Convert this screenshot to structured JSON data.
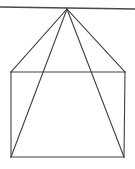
{
  "figure": {
    "type": "geometric-line-drawing",
    "background_color": "#ffffff",
    "line_color": "#404040",
    "horizon_line_color": "#4a4a4a",
    "canvas": {
      "width": 135,
      "height": 169
    },
    "points": {
      "apex": {
        "label": "apex",
        "x": 67,
        "y": 9
      },
      "top_left": {
        "label": "top-left",
        "x": 11,
        "y": 72
      },
      "top_right": {
        "label": "top-right",
        "x": 125,
        "y": 72
      },
      "bottom_left": {
        "label": "bottom-left",
        "x": 11,
        "y": 157
      },
      "bottom_right": {
        "label": "bottom-right",
        "x": 124,
        "y": 157
      },
      "horizon_left": {
        "label": "horizon-left",
        "x": 0,
        "y": 7
      },
      "horizon_right": {
        "label": "horizon-right",
        "x": 135,
        "y": 9
      }
    },
    "segments": [
      {
        "name": "horizon-line",
        "from": "horizon_left",
        "to": "horizon_right"
      },
      {
        "name": "rect-top-edge",
        "from": "top_left",
        "to": "top_right"
      },
      {
        "name": "rect-right-edge",
        "from": "top_right",
        "to": "bottom_right"
      },
      {
        "name": "rect-bottom-edge",
        "from": "bottom_right",
        "to": "bottom_left"
      },
      {
        "name": "rect-left-edge",
        "from": "bottom_left",
        "to": "top_left"
      },
      {
        "name": "apex-to-top-left",
        "from": "apex",
        "to": "top_left"
      },
      {
        "name": "apex-to-top-right",
        "from": "apex",
        "to": "top_right"
      },
      {
        "name": "apex-to-bottom-left",
        "from": "apex",
        "to": "bottom_left"
      },
      {
        "name": "apex-to-bottom-right",
        "from": "apex",
        "to": "bottom_right"
      }
    ]
  }
}
